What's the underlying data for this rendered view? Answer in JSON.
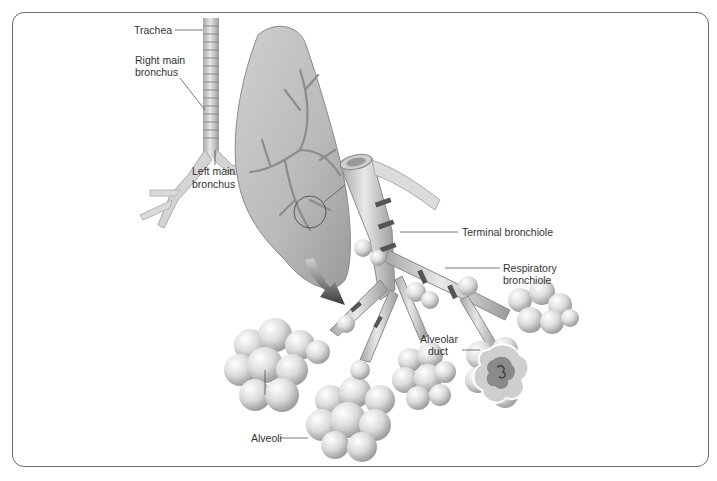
{
  "diagram": {
    "type": "anatomical-illustration",
    "labels": {
      "trachea": "Trachea",
      "right_main_bronchus_1": "Right main",
      "right_main_bronchus_2": "bronchus",
      "left_main_bronchus_1": "Left main",
      "left_main_bronchus_2": "bronchus",
      "terminal_bronchiole": "Terminal bronchiole",
      "respiratory_bronchiole_1": "Respiratory",
      "respiratory_bronchiole_2": "bronchiole",
      "alveolar_duct_1": "Alveolar",
      "alveolar_duct_2": "duct",
      "alveoli": "Alveoli"
    },
    "colors": {
      "frame": "#6a6a6a",
      "tissue_light": "#e6e6e6",
      "tissue_mid": "#bdbdbd",
      "tissue_dark": "#7a7a7a",
      "band": "#4a4a4a",
      "leader": "#555555"
    }
  }
}
